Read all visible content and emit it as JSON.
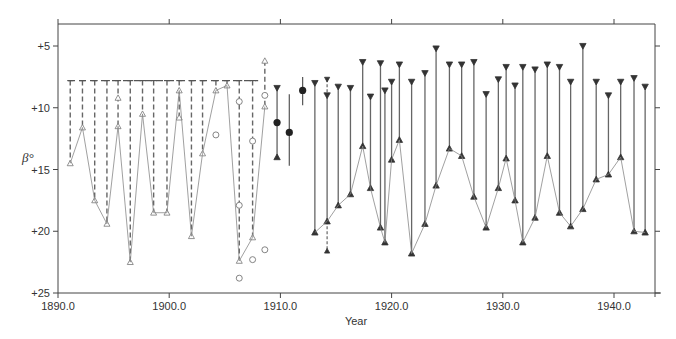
{
  "chart_data": {
    "type": "scatter",
    "title": "",
    "xlabel": "Year",
    "ylabel": "β°",
    "xlim": [
      1890.0,
      1943.5
    ],
    "ylim": [
      25,
      2.5
    ],
    "y_inverted": true,
    "grid": false,
    "legend": null,
    "x_ticks": [
      "1890.0",
      "1900.0",
      "1910.0",
      "1920.0",
      "1930.0",
      "1940.0"
    ],
    "y_ticks": [
      "+5",
      "+10",
      "+15",
      "+20",
      "+25"
    ],
    "series": [
      {
        "name": "open-triangle ranges (dashed, upper limit +7.8)",
        "marker": "open-triangle",
        "range_top": 7.8,
        "points": [
          {
            "x": 1891.1,
            "y": [
              14.5
            ]
          },
          {
            "x": 1892.2,
            "y": [
              11.6
            ]
          },
          {
            "x": 1893.3,
            "y": [
              17.5
            ]
          },
          {
            "x": 1894.4,
            "y": [
              19.4
            ]
          },
          {
            "x": 1895.4,
            "y": [
              9.2,
              11.5
            ]
          },
          {
            "x": 1896.5,
            "y": [
              22.5
            ]
          },
          {
            "x": 1897.6,
            "y": [
              10.5
            ]
          },
          {
            "x": 1898.6,
            "y": [
              18.5
            ]
          },
          {
            "x": 1899.8,
            "y": [
              18.5
            ]
          },
          {
            "x": 1900.9,
            "y": [
              8.6,
              10.8
            ]
          },
          {
            "x": 1902.0,
            "y": [
              20.4
            ]
          },
          {
            "x": 1903.0,
            "y": [
              13.7
            ]
          },
          {
            "x": 1904.2,
            "y": [
              8.6
            ]
          },
          {
            "x": 1905.2,
            "y": [
              8.2
            ]
          },
          {
            "x": 1906.3,
            "y": [
              22.4
            ]
          },
          {
            "x": 1907.5,
            "y": [
              20.5
            ]
          },
          {
            "x": 1908.6,
            "y": [
              6.2,
              9.9
            ]
          }
        ]
      },
      {
        "name": "open circles",
        "marker": "open-circle",
        "points": [
          {
            "x": 1904.2,
            "y": 12.2
          },
          {
            "x": 1906.3,
            "y": 9.5
          },
          {
            "x": 1906.3,
            "y": 17.9
          },
          {
            "x": 1906.3,
            "y": 23.8
          },
          {
            "x": 1907.5,
            "y": 12.7
          },
          {
            "x": 1907.5,
            "y": 22.3
          },
          {
            "x": 1908.6,
            "y": 9.0
          },
          {
            "x": 1908.6,
            "y": 21.5
          }
        ]
      },
      {
        "name": "filled circles with ranges",
        "marker": "filled-circle",
        "points": [
          {
            "x": 1909.7,
            "y": 11.2,
            "range": [
              8.4,
              14.0
            ]
          },
          {
            "x": 1910.8,
            "y": 12.0,
            "range": [
              8.9,
              14.7
            ]
          },
          {
            "x": 1912.0,
            "y": 8.6,
            "range": [
              7.5,
              9.8
            ]
          }
        ]
      },
      {
        "name": "filled-triangle ranges (top ▼, bottom ▲)",
        "marker": "filled-triangle",
        "points": [
          {
            "x": 1913.1,
            "top": 8.0,
            "bottom": 20.1
          },
          {
            "x": 1914.2,
            "top": 7.7,
            "top2": 9.0,
            "bottom": 19.2,
            "extra": 21.6
          },
          {
            "x": 1915.2,
            "top": 8.3,
            "bottom": 17.9
          },
          {
            "x": 1916.3,
            "top": 8.4,
            "bottom": 17.0
          },
          {
            "x": 1917.4,
            "top": 6.3,
            "bottom": 13.1
          },
          {
            "x": 1918.1,
            "top": 9.1,
            "bottom": 16.5
          },
          {
            "x": 1919.0,
            "top": 6.4,
            "bottom": 19.7
          },
          {
            "x": 1919.4,
            "top": 8.6,
            "bottom": 20.9
          },
          {
            "x": 1920.0,
            "top": 7.9,
            "bottom": 14.2
          },
          {
            "x": 1920.7,
            "top": 6.5,
            "bottom": 12.6
          },
          {
            "x": 1921.8,
            "top": 7.9,
            "bottom": 21.8
          },
          {
            "x": 1923.0,
            "top": 7.2,
            "bottom": 19.4
          },
          {
            "x": 1924.0,
            "top": 5.2,
            "bottom": 16.3
          },
          {
            "x": 1925.2,
            "top": 6.5,
            "bottom": 13.3
          },
          {
            "x": 1926.3,
            "top": 6.5,
            "bottom": 13.9
          },
          {
            "x": 1927.4,
            "top": 6.3,
            "bottom": 17.2
          },
          {
            "x": 1928.5,
            "top": 8.9,
            "bottom": 19.7
          },
          {
            "x": 1929.6,
            "top": 7.7,
            "bottom": 16.5
          },
          {
            "x": 1930.3,
            "top": 6.7,
            "bottom": 14.1
          },
          {
            "x": 1931.1,
            "top": 8.2,
            "bottom": 17.5
          },
          {
            "x": 1931.8,
            "top": 6.7,
            "bottom": 20.9
          },
          {
            "x": 1932.9,
            "top": 6.9,
            "bottom": 18.9
          },
          {
            "x": 1934.0,
            "top": 6.5,
            "bottom": 13.9
          },
          {
            "x": 1935.1,
            "top": 6.7,
            "bottom": 18.5
          },
          {
            "x": 1936.1,
            "top": 7.9,
            "bottom": 19.6
          },
          {
            "x": 1937.2,
            "top": 5.0,
            "bottom": 18.2
          },
          {
            "x": 1938.4,
            "top": 7.9,
            "bottom": 15.8
          },
          {
            "x": 1939.5,
            "top": 9.0,
            "bottom": 15.4
          },
          {
            "x": 1940.6,
            "top": 7.9,
            "bottom": 14.0
          },
          {
            "x": 1941.8,
            "top": 7.6,
            "bottom": 20.0
          },
          {
            "x": 1942.8,
            "top": 8.3,
            "bottom": 20.1
          }
        ]
      }
    ]
  },
  "axes": {
    "x_title": "Year",
    "y_title": "β°",
    "x_tick_labels": [
      "1890.0",
      "1900.0",
      "1910.0",
      "1920.0",
      "1930.0",
      "1940.0"
    ],
    "y_tick_labels": [
      "+5",
      "+10",
      "+15",
      "+20",
      "+25"
    ]
  }
}
